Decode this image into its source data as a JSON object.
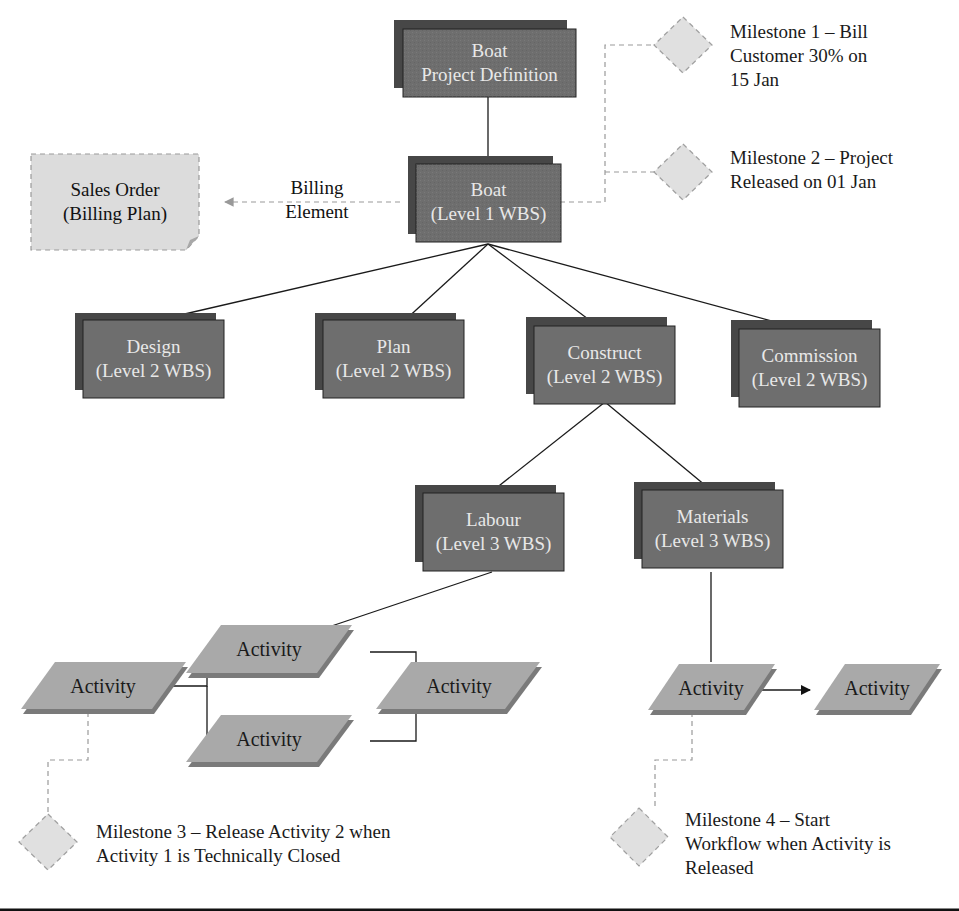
{
  "colors": {
    "wbs_fill": "#6e6e6e",
    "wbs_shadow": "#474747",
    "wbs_text": "#e8e8e8",
    "activity_fill": "#a9a9a9",
    "activity_shadow": "#7a7a7a",
    "milestone_fill": "#e0e0e0",
    "sales_order_fill": "#dcdcdc",
    "connector": "#1a1a1a",
    "dashed": "#9a9a9a"
  },
  "project_definition": {
    "line1": "Boat",
    "line2": "Project Definition"
  },
  "level1": {
    "line1": "Boat",
    "line2": "(Level 1 WBS)"
  },
  "sales_order": {
    "line1": "Sales Order",
    "line2": "(Billing Plan)"
  },
  "billing_element": {
    "line1": "Billing",
    "line2": "Element"
  },
  "level2": [
    {
      "line1": "Design",
      "line2": "(Level 2 WBS)"
    },
    {
      "line1": "Plan",
      "line2": "(Level 2 WBS)"
    },
    {
      "line1": "Construct",
      "line2": "(Level 2 WBS)"
    },
    {
      "line1": "Commission",
      "line2": "(Level 2 WBS)"
    }
  ],
  "level3": [
    {
      "line1": "Labour",
      "line2": "(Level 3 WBS)"
    },
    {
      "line1": "Materials",
      "line2": "(Level 3 WBS)"
    }
  ],
  "activities": [
    {
      "label": "Activity"
    },
    {
      "label": "Activity"
    },
    {
      "label": "Activity"
    },
    {
      "label": "Activity"
    },
    {
      "label": "Activity"
    },
    {
      "label": "Activity"
    }
  ],
  "milestones": [
    {
      "lines": [
        "Milestone 1 – Bill",
        "Customer 30% on",
        "15 Jan"
      ]
    },
    {
      "lines": [
        "Milestone 2 – Project",
        "Released on 01 Jan"
      ]
    },
    {
      "lines": [
        "Milestone 3 – Release Activity 2 when",
        "Activity 1 is Technically Closed"
      ]
    },
    {
      "lines": [
        "Milestone 4 – Start",
        "Workflow when Activity is",
        "Released"
      ]
    }
  ]
}
